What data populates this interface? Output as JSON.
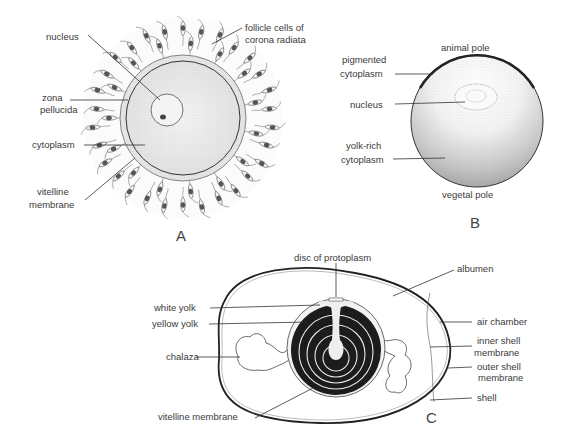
{
  "figure_a": {
    "panel_label": "A",
    "labels": {
      "nucleus": "nucleus",
      "follicle_1": "follicle cells of",
      "follicle_2": "corona radiata",
      "zona_1": "zona",
      "zona_2": "pellucida",
      "cytoplasm": "cytoplasm",
      "vitelline_1": "vitelline",
      "vitelline_2": "membrane"
    }
  },
  "figure_b": {
    "panel_label": "B",
    "labels": {
      "animal_pole": "animal pole",
      "pigmented_1": "pigmented",
      "pigmented_2": "cytoplasm",
      "nucleus": "nucleus",
      "yolk_rich_1": "yolk-rich",
      "yolk_rich_2": "cytoplasm",
      "vegetal_pole": "vegetal pole"
    }
  },
  "figure_c": {
    "panel_label": "C",
    "labels": {
      "disc": "disc of protoplasm",
      "albumen": "albumen",
      "white_yolk": "white yolk",
      "yellow_yolk": "yellow yolk",
      "air_chamber": "air chamber",
      "inner_shell_1": "inner shell",
      "inner_shell_2": "membrane",
      "chalaza": "chalaza",
      "outer_shell_1": "outer shell",
      "outer_shell_2": "membrane",
      "shell": "shell",
      "vitelline": "vitelline membrane"
    }
  }
}
